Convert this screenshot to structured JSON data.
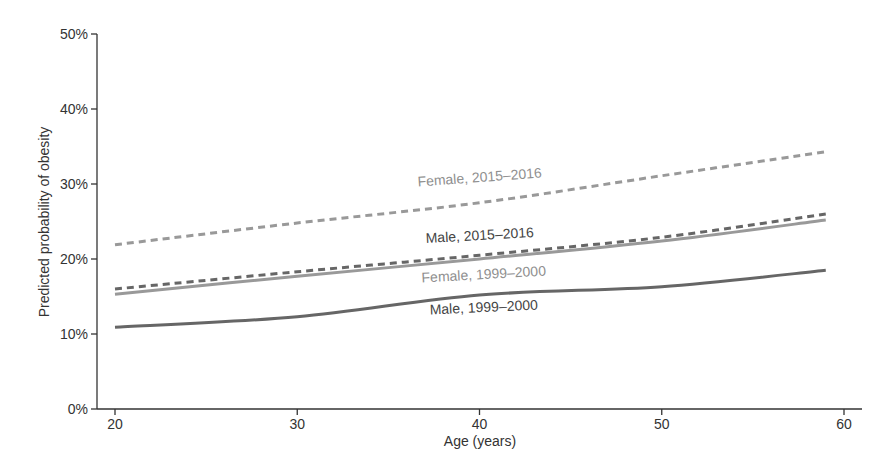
{
  "chart_data": {
    "type": "line",
    "title": "",
    "xlabel": "Age (years)",
    "ylabel": "Predicted probability of obesity",
    "xlim": [
      19,
      61.5
    ],
    "ylim": [
      0,
      50
    ],
    "xticks": [
      20,
      30,
      40,
      50,
      60
    ],
    "xtick_labels": [
      "20",
      "30",
      "40",
      "50",
      "60"
    ],
    "yticks": [
      0,
      10,
      20,
      30,
      40,
      50
    ],
    "ytick_labels": [
      "0%",
      "10%",
      "20%",
      "30%",
      "40%",
      "50%"
    ],
    "grid": false,
    "legend": "inline labels",
    "x": [
      20,
      30,
      40,
      50,
      59
    ],
    "series": [
      {
        "name": "Female, 2015–2016",
        "style": "dashed",
        "color": "#999999",
        "values": [
          21.9,
          24.8,
          27.5,
          31.1,
          34.3
        ],
        "label_pos": {
          "x": 480,
          "y": 182,
          "angle": -4.2
        }
      },
      {
        "name": "Male, 2015–2016",
        "style": "dashed",
        "color": "#666666",
        "values": [
          16.0,
          18.3,
          20.5,
          22.9,
          26.0
        ],
        "label_pos": {
          "x": 480,
          "y": 240,
          "angle": -3.2
        }
      },
      {
        "name": "Female, 1999–2000",
        "style": "solid",
        "color": "#999999",
        "values": [
          15.3,
          17.7,
          20.0,
          22.4,
          25.2
        ],
        "label_pos": {
          "x": 484,
          "y": 279,
          "angle": -3.2
        }
      },
      {
        "name": "Male, 1999–2000",
        "style": "solid",
        "color": "#666666",
        "values": [
          10.9,
          12.3,
          15.2,
          16.3,
          18.5
        ],
        "label_pos": {
          "x": 484,
          "y": 312,
          "angle": -2.6
        }
      }
    ]
  }
}
